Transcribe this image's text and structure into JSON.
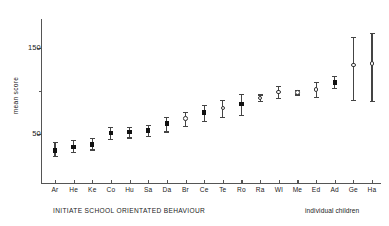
{
  "chart_data": {
    "type": "scatter",
    "title": "",
    "subtitle": "",
    "xlabel": "INITIATE SCHOOL ORIENTATED BEHAVIOUR",
    "xlabel_right": "individual children",
    "ylabel": "mean score",
    "ylim": [
      0,
      190
    ],
    "yticks": [
      50,
      150
    ],
    "ytick_labels": [
      "50",
      "150"
    ],
    "grid": false,
    "legend": "none",
    "categories": [
      "Ar",
      "He",
      "Ke",
      "Co",
      "Hu",
      "Sa",
      "Da",
      "Br",
      "Ce",
      "Te",
      "Ro",
      "Ra",
      "Wl",
      "Me",
      "Ed",
      "Ad",
      "Ge",
      "Ha"
    ],
    "values": [
      31,
      35,
      38,
      51,
      52,
      54,
      62,
      68,
      75,
      80,
      85,
      92,
      99,
      98,
      102,
      110,
      130,
      132
    ],
    "errors_low": [
      24,
      29,
      32,
      44,
      46,
      48,
      53,
      59,
      65,
      70,
      72,
      88,
      92,
      96,
      93,
      104,
      90,
      88
    ],
    "errors_high": [
      41,
      43,
      45,
      58,
      58,
      60,
      70,
      76,
      84,
      90,
      97,
      96,
      106,
      101,
      111,
      117,
      163,
      168
    ],
    "marker_styles": [
      "filled",
      "filled",
      "filled",
      "filled",
      "filled",
      "filled",
      "filled",
      "open",
      "filled",
      "open",
      "filled",
      "open",
      "open",
      "open",
      "open",
      "filled",
      "open",
      "open"
    ]
  },
  "axis": {
    "y_label": "mean score",
    "y_tick_150": "150",
    "y_tick_50": "50"
  },
  "captions": {
    "left": "INITIATE SCHOOL ORIENTATED BEHAVIOUR",
    "right": "individual children"
  },
  "colors": {
    "axis": "#555555",
    "marker_fill": "#111111",
    "marker_open_stroke": "#333333",
    "error_bar": "#444444",
    "background": "#ffffff"
  }
}
